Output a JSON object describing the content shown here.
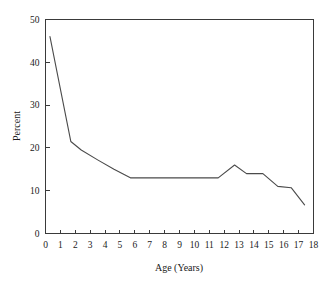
{
  "chart_data": {
    "type": "line",
    "title": "",
    "xlabel": "Age (Years)",
    "ylabel": "Percent",
    "xlim": [
      0,
      18
    ],
    "ylim": [
      0,
      50
    ],
    "xticks": [
      0,
      1,
      2,
      3,
      4,
      5,
      6,
      7,
      8,
      9,
      10,
      11,
      12,
      13,
      14,
      15,
      16,
      17,
      18
    ],
    "yticks": [
      0,
      10,
      20,
      30,
      40,
      50
    ],
    "grid": false,
    "legend": null,
    "series": [
      {
        "name": "Percent by age",
        "x": [
          0.3,
          1.7,
          2.4,
          3.5,
          4.6,
          5.7,
          11.6,
          12.7,
          13.5,
          14.6,
          15.6,
          16.5,
          17.4
        ],
        "values": [
          46.0,
          21.5,
          19.5,
          17.2,
          15.0,
          13.0,
          13.0,
          16.0,
          14.0,
          14.0,
          11.0,
          10.7,
          6.7
        ]
      }
    ]
  },
  "axes": {
    "x_label": "Age (Years)",
    "y_label": "Percent",
    "x_tick_labels": [
      "0",
      "1",
      "2",
      "3",
      "4",
      "5",
      "6",
      "7",
      "8",
      "9",
      "10",
      "11",
      "12",
      "13",
      "14",
      "15",
      "16",
      "17",
      "18"
    ],
    "y_tick_labels": [
      "0",
      "10",
      "20",
      "30",
      "40",
      "50"
    ]
  },
  "colors": {
    "line": "#4a4a4a",
    "axis": "#3a3a3a",
    "text": "#1a1a1a",
    "background": "#ffffff"
  }
}
